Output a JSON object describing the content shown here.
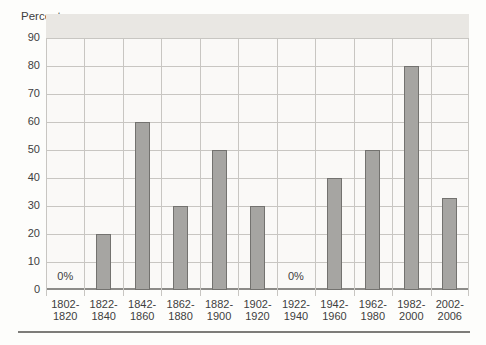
{
  "chart_data": {
    "type": "bar",
    "y_axis_title": "Percent",
    "categories": [
      [
        "1802-",
        "1820"
      ],
      [
        "1822-",
        "1840"
      ],
      [
        "1842-",
        "1860"
      ],
      [
        "1862-",
        "1880"
      ],
      [
        "1882-",
        "1900"
      ],
      [
        "1902-",
        "1920"
      ],
      [
        "1922-",
        "1940"
      ],
      [
        "1942-",
        "1960"
      ],
      [
        "1962-",
        "1980"
      ],
      [
        "1982-",
        "2000"
      ],
      [
        "2002-",
        "2006"
      ]
    ],
    "values": [
      0,
      20,
      60,
      30,
      50,
      30,
      0,
      40,
      50,
      80,
      33
    ],
    "zero_value_label": "0%",
    "yticks": [
      90,
      80,
      70,
      60,
      50,
      40,
      30,
      20,
      10,
      0
    ],
    "ylim": [
      0,
      90
    ],
    "grid": "on",
    "legend": "none",
    "colors": {
      "page_bg": "#fdfdfb",
      "plot_bg": "#faf9f7",
      "top_band": "#e9e7e3",
      "gridline": "#c8c6c2",
      "baseline": "#8c8b88",
      "bar_fill": "#a6a5a2",
      "bar_border": "#73726f",
      "text": "#3e3e3e",
      "rule": "#7d7c79"
    }
  }
}
